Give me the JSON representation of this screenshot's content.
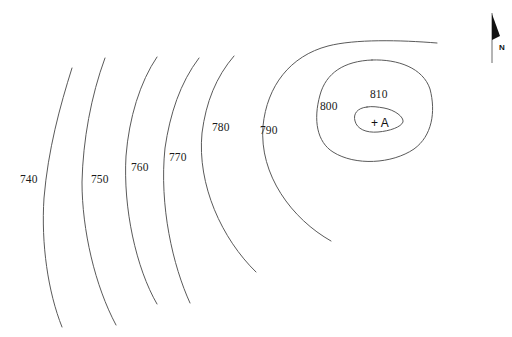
{
  "map": {
    "type": "topographic-contour-map",
    "background_color": "#ffffff",
    "contour_line_color": "#5a5a5a",
    "label_color": "#1a1a1a",
    "contour_interval": 10,
    "elevation_units_visible": false,
    "spot_elevation": {
      "marker": "+",
      "label": "A",
      "combined": "+ A",
      "x": 371,
      "y": 117,
      "description": "summit spot marker inside the 810 contour"
    },
    "north_arrow": {
      "label": "N",
      "orientation": "up",
      "x": 492,
      "y": 14
    },
    "contours": [
      {
        "value": "740",
        "label_x": 20,
        "label_y": 174,
        "closed": false,
        "path": "M 72 68 C 60 106 48 150 44 198 C 41 244 48 292 62 327"
      },
      {
        "value": "750",
        "label_x": 91,
        "label_y": 174,
        "closed": false,
        "path": "M 105 58 C 91 96 83 140 82 182 C 82 230 95 286 116 325"
      },
      {
        "value": "760",
        "label_x": 131,
        "label_y": 162,
        "closed": false,
        "path": "M 157 57 C 140 82 129 118 126 156 C 123 208 136 268 157 304"
      },
      {
        "value": "770",
        "label_x": 169,
        "label_y": 152,
        "closed": false,
        "path": "M 199 58 C 180 83 170 114 165 148 C 159 206 173 266 190 303"
      },
      {
        "value": "780",
        "label_x": 212,
        "label_y": 122,
        "closed": false,
        "path": "M 234 56 C 216 77 206 102 202 133 C 197 185 222 239 256 272"
      },
      {
        "value": "790",
        "label_x": 260,
        "label_y": 125,
        "closed": false,
        "path": "M 437 43 C 400 40 355 39 328 46 C 290 56 267 86 263 126 C 259 175 292 219 331 241"
      },
      {
        "value": "800",
        "label_x": 320,
        "label_y": 101,
        "closed": true,
        "path": "M 372 60 C 344 61 326 73 320 95 C 313 120 317 142 333 152 C 355 166 392 164 414 149 C 432 136 436 112 430 89 C 423 68 398 59 372 60 Z"
      },
      {
        "value": "810",
        "label_x": 370,
        "label_y": 89,
        "closed": true,
        "path": "M 367 107 C 357 108 353 114 355 121 C 357 129 366 133 378 132 C 390 131 401 127 403 122 C 404 117 395 110 384 108 C 378 107 372 106 367 107 Z"
      }
    ]
  }
}
